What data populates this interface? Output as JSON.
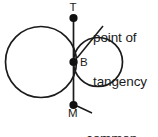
{
  "figure": {
    "background_color": "#ffffff",
    "stroke_color": "#1b1b1b",
    "annotations": {
      "point_of_tangency": {
        "line1": "point of",
        "line2": "tangency"
      },
      "common_tangent": {
        "line1": "common",
        "line2": "tangent"
      }
    },
    "points": [
      {
        "id": "T",
        "label": "T",
        "role": "tangent-line-top-endpoint",
        "x": 73.5,
        "y": 18
      },
      {
        "id": "B",
        "label": "B",
        "role": "point-of-tangency",
        "x": 73.5,
        "y": 62
      },
      {
        "id": "M",
        "label": "M",
        "role": "tangent-line-bottom-endpoint",
        "x": 73.5,
        "y": 105
      }
    ],
    "circles": [
      {
        "id": "left-circle",
        "cx": 41,
        "cy": 62,
        "r": 35.5
      },
      {
        "id": "right-circle",
        "cx": 98,
        "cy": 62,
        "r": 24.5
      }
    ],
    "tangent_line": {
      "x": 73.5,
      "y1": 18,
      "y2": 105
    }
  }
}
